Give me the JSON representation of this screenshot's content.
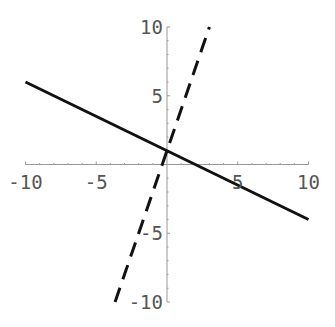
{
  "chart_data": {
    "type": "line",
    "title": "",
    "xlabel": "",
    "ylabel": "",
    "xlim": [
      -10,
      10
    ],
    "ylim": [
      -10,
      10
    ],
    "grid": false,
    "x_ticks": [
      -10,
      -5,
      5,
      10
    ],
    "y_ticks": [
      -10,
      -5,
      5,
      10
    ],
    "x_tick_labels": [
      "-10",
      "-5",
      "5",
      "10"
    ],
    "y_tick_labels": [
      "-10",
      "-5",
      "5",
      "10"
    ],
    "series": [
      {
        "name": "solid line",
        "style": "solid",
        "color": "#111111",
        "equation": "y = -0.5x + 1",
        "x": [
          -10,
          10
        ],
        "y": [
          6,
          -4
        ]
      },
      {
        "name": "dashed line",
        "style": "dashed",
        "color": "#111111",
        "equation": "y = 3x + 1",
        "x": [
          -3.67,
          3
        ],
        "y": [
          -10,
          10
        ]
      }
    ]
  }
}
